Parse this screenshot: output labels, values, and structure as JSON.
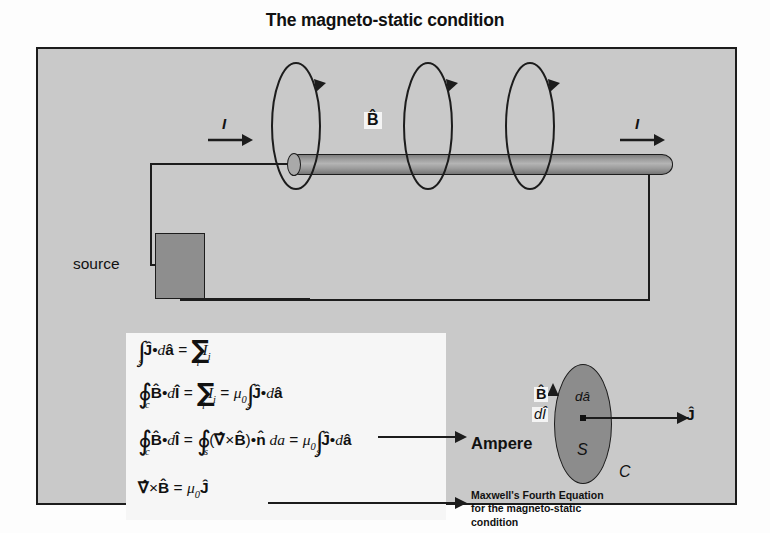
{
  "slide": {
    "title": "The magneto-static condition"
  },
  "circuit": {
    "source_label": "source",
    "current_left": "I",
    "current_right": "I",
    "b_field_label": "B̂"
  },
  "equations": [
    {
      "id": "flux-of-current-density",
      "text": "∫_s Ĵ•dâ = ∑_i I_i"
    },
    {
      "id": "ampere-circuital-law",
      "text": "∮_c B̂•dÎ = ∑_i I_i = μ₀ ∫_s Ĵ•dâ"
    },
    {
      "id": "stokes-theorem-form",
      "text": "∮_c B̂•dÎ = ∮_s (∇̂×B̂)•n̂ da = μ₀ ∫_s Ĵ•dâ"
    },
    {
      "id": "differential-form",
      "text": "∇̂×B̂ = μ₀Ĵ"
    }
  ],
  "callouts": {
    "ampere": "Ampere",
    "maxwell_line1": "Maxwell's Fourth Equation",
    "maxwell_line2": "for the magneto-static",
    "maxwell_line3": "condition"
  },
  "surface_figure": {
    "area_element": "dâ",
    "surface": "S",
    "contour": "C",
    "b_field": "B̂",
    "line_element": "dÎ",
    "current_density": "Ĵ"
  },
  "colors": {
    "frame_background": "#c9c9c9",
    "frame_border": "#1c1c1c",
    "conductor_fill": "#9c9c9c",
    "source_fill": "#8e8e8e",
    "equation_panel": "#f6f6f6",
    "surface_fill": "#8c8c8c",
    "text": "#111111"
  }
}
